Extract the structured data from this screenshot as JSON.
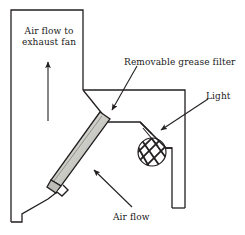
{
  "figure": {
    "type": "technical-cross-section-diagram",
    "background_color": "#ffffff",
    "line_color": "#231f20",
    "filter_fill_color": "#c9c9c4"
  },
  "labels": {
    "airflow_exhaust_line1": "Air flow to",
    "airflow_exhaust_line2": "exhaust fan",
    "grease_filter": "Removable grease filter",
    "light": "Light",
    "airflow": "Air flow"
  },
  "parts": [
    {
      "name": "exhaust-duct",
      "label": "Air flow to exhaust fan"
    },
    {
      "name": "grease-filter",
      "label": "Removable grease filter"
    },
    {
      "name": "light-fixture",
      "label": "Light"
    },
    {
      "name": "intake-airflow",
      "label": "Air flow"
    }
  ]
}
